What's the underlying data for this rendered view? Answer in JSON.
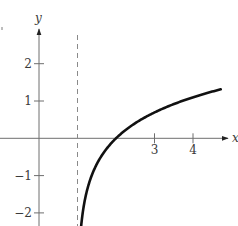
{
  "chart_data": {
    "type": "line",
    "title": "",
    "function": "y = ln(x - 1)",
    "xlabel": "x",
    "ylabel": "y",
    "x_ticks": [
      3,
      4
    ],
    "y_ticks": [
      -2,
      -1,
      1,
      2
    ],
    "xlim": [
      -0.35,
      4.95
    ],
    "ylim": [
      -2.35,
      2.95
    ],
    "grid": false,
    "asymptote": {
      "type": "vertical",
      "x": 1,
      "style": "dashed"
    },
    "series": [
      {
        "name": "ln(x-1)",
        "x": [
          1.095,
          1.1,
          1.2,
          1.3,
          1.5,
          1.75,
          2.0,
          2.5,
          3.0,
          3.5,
          4.0,
          4.5,
          4.72
        ],
        "y": [
          -2.35,
          -2.3,
          -1.61,
          -1.2,
          -0.69,
          -0.29,
          0.0,
          0.41,
          0.69,
          0.92,
          1.1,
          1.25,
          1.31
        ]
      }
    ],
    "annotations": []
  },
  "layout": {
    "origin_px": [
      39,
      138.3
    ],
    "px_per_unit_x": 38.5,
    "px_per_unit_y": 37.3,
    "x_axis": {
      "x_start": 0,
      "arrow_tip": 227
    },
    "y_axis": {
      "y_bottom": 226,
      "arrow_tip": 29
    },
    "axis_color": "#6e6e6e",
    "curve_color": "#111111",
    "dash_color": "#8a8a8a"
  },
  "labels": {
    "x_axis": "x",
    "y_axis": "y",
    "ticks_x": [
      "3",
      "4"
    ],
    "ticks_y_pos": [
      "1",
      "2"
    ],
    "ticks_y_neg": [
      "−1",
      "−2"
    ]
  }
}
